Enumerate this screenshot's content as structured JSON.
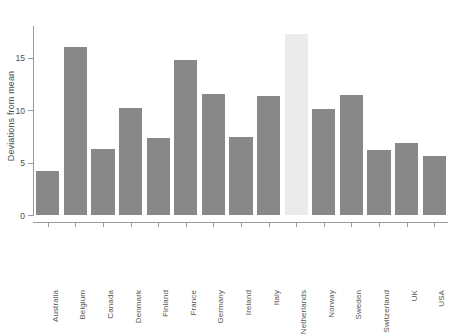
{
  "chart_data": {
    "type": "bar",
    "title": "",
    "xlabel": "",
    "ylabel": "Deviations from mean",
    "categories": [
      "Australia",
      "Belgium",
      "Canada",
      "Denmark",
      "Finland",
      "France",
      "Germany",
      "Ireland",
      "Italy",
      "Netherlands",
      "Norway",
      "Sweden",
      "Switzerland",
      "UK",
      "USA"
    ],
    "values": [
      4.2,
      16.0,
      6.3,
      10.2,
      7.3,
      14.8,
      11.5,
      7.4,
      11.3,
      17.2,
      10.1,
      11.4,
      6.2,
      6.9,
      5.6
    ],
    "ylim": [
      0,
      18
    ],
    "yticks": [
      0,
      5,
      10,
      15
    ],
    "ytick_labels": [
      "0",
      "5",
      "10",
      "15"
    ],
    "grid": false,
    "legend": null,
    "highlight_category": "Netherlands",
    "colors": {
      "bar": "#888888",
      "highlight_bar": "#ebebeb",
      "axis": "#9a9a9a",
      "text": "#4d4d4d",
      "background": "#ffffff"
    }
  }
}
